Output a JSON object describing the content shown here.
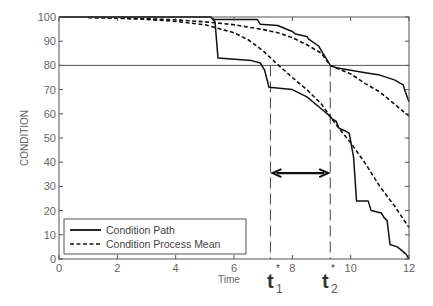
{
  "chart_data": {
    "type": "line",
    "title": "",
    "xlabel": "Time",
    "ylabel": "CONDITION",
    "xlim": [
      0,
      12
    ],
    "ylim": [
      0,
      100
    ],
    "xticks": [
      0,
      2,
      4,
      6,
      8,
      10,
      12
    ],
    "yticks": [
      0,
      10,
      20,
      30,
      40,
      50,
      60,
      70,
      80,
      90,
      100
    ],
    "grid": false,
    "legend_position": "lower left",
    "legend": [
      {
        "label": "Condition Path",
        "style": "solid"
      },
      {
        "label": "Condition Process Mean",
        "style": "dashed"
      }
    ],
    "threshold": {
      "y": 80,
      "label": ""
    },
    "annotations": [
      {
        "label": "t",
        "subscript": "1",
        "superscript": "*",
        "x": 7.25
      },
      {
        "label": "t",
        "subscript": "2",
        "superscript": "*",
        "x": 9.3
      },
      {
        "type": "double-arrow",
        "from_x": 7.25,
        "to_x": 9.3,
        "y": 35.5
      }
    ],
    "series": [
      {
        "name": "Condition Path (upper)",
        "style": "solid",
        "x": [
          0,
          5.2,
          5.3,
          6.8,
          6.9,
          7.5,
          7.6,
          8.0,
          8.1,
          8.5,
          8.55,
          8.9,
          9.0,
          9.1,
          9.3,
          9.5,
          10.0,
          10.5,
          11.0,
          11.5,
          11.8,
          11.85,
          12.0
        ],
        "y": [
          100,
          100,
          99,
          99,
          97,
          96.5,
          96,
          94,
          93,
          92,
          91,
          88,
          86,
          84,
          80,
          79,
          78,
          77,
          76,
          74,
          72,
          70,
          65
        ]
      },
      {
        "name": "Condition Path (lower)",
        "style": "solid",
        "x": [
          0,
          5.2,
          5.35,
          5.45,
          6.6,
          6.9,
          7.05,
          7.2,
          8.0,
          8.5,
          9.0,
          9.2,
          9.35,
          9.5,
          9.6,
          9.8,
          9.95,
          10.1,
          10.2,
          10.6,
          10.7,
          11.05,
          11.15,
          11.25,
          11.35,
          11.6,
          11.9,
          12.0
        ],
        "y": [
          100,
          100,
          98,
          83,
          82,
          81,
          78,
          71,
          70,
          67,
          62,
          60,
          58,
          57,
          54,
          53,
          52,
          42,
          24,
          24,
          20,
          19,
          17,
          16,
          6,
          5,
          2,
          0
        ]
      },
      {
        "name": "Condition Process Mean (upper)",
        "style": "dashed",
        "x": [
          1,
          2,
          3,
          4,
          5,
          6,
          7,
          7.5,
          8,
          8.5,
          9,
          9.3,
          10,
          10.5,
          11,
          11.5,
          12
        ],
        "y": [
          99.8,
          99.6,
          99.3,
          98.8,
          98,
          96.8,
          94.8,
          93.5,
          91.5,
          88.5,
          85,
          80,
          76.5,
          72.5,
          69,
          64,
          59
        ]
      },
      {
        "name": "Condition Process Mean (lower)",
        "style": "dashed",
        "x": [
          1,
          2,
          3,
          4,
          5,
          6,
          6.5,
          7,
          7.4,
          8,
          8.5,
          9,
          9.5,
          10,
          10.5,
          11,
          11.5,
          12
        ],
        "y": [
          99.8,
          99.5,
          99,
          98.2,
          96.8,
          93.5,
          90.5,
          86,
          81.5,
          75,
          70,
          64,
          55.5,
          48,
          39.5,
          30,
          22,
          13
        ]
      }
    ]
  },
  "axes": {
    "xlabel": "Time",
    "ylabel": "CONDITION",
    "xtick_labels": [
      "0",
      "2",
      "4",
      "6",
      "8",
      "10",
      "12"
    ],
    "ytick_labels": [
      "0",
      "10",
      "20",
      "30",
      "40",
      "50",
      "60",
      "70",
      "80",
      "90",
      "100"
    ]
  },
  "legend": {
    "items": [
      {
        "label": "Condition Path"
      },
      {
        "label": "Condition Process Mean"
      }
    ]
  },
  "markers": {
    "t1": {
      "base": "t",
      "sub": "1",
      "sup": "*"
    },
    "t2": {
      "base": "t",
      "sub": "2",
      "sup": "*"
    }
  }
}
